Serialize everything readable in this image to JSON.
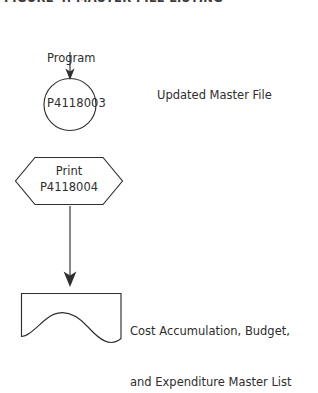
{
  "page": {
    "heading": "FIGURE 4. MASTER FILE LISTING",
    "background_color": "#ffffff",
    "ink_color": "#2f2f2f"
  },
  "flowchart": {
    "type": "flowchart",
    "orientation": "top-to-bottom",
    "nodes": [
      {
        "id": "program-annotation",
        "shape": "text",
        "line1": "Program",
        "line2": "P4118003"
      },
      {
        "id": "process-circle",
        "shape": "circle",
        "label": ""
      },
      {
        "id": "updated-master-file",
        "shape": "text",
        "label": "Updated Master File"
      },
      {
        "id": "print-hexagon",
        "shape": "hexagon",
        "line1": "Print",
        "line2": "P4118004"
      },
      {
        "id": "output-document",
        "shape": "document",
        "label": ""
      },
      {
        "id": "output-document-label",
        "shape": "text",
        "line1": "Cost Accumulation, Budget,",
        "line2": "and Expenditure Master List"
      }
    ],
    "connectors": [
      {
        "id": "arrow-program-to-circle",
        "from": "program-annotation",
        "to": "process-circle",
        "style": "arrow-down"
      },
      {
        "id": "arrow-hexagon-to-document",
        "from": "print-hexagon",
        "to": "output-document",
        "style": "arrow-down"
      }
    ]
  }
}
